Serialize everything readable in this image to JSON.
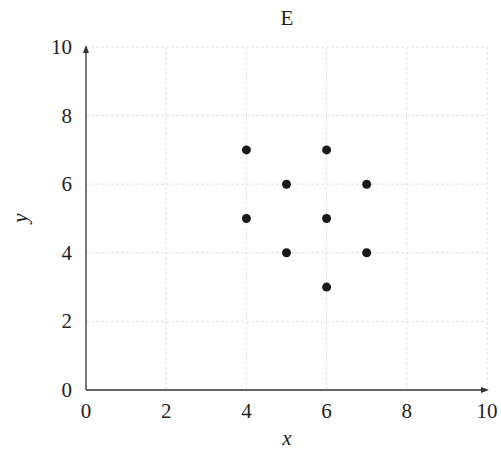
{
  "chart_data": {
    "type": "scatter",
    "title": "E",
    "xlabel": "x",
    "ylabel": "y",
    "xlim": [
      0,
      10
    ],
    "ylim": [
      0,
      10
    ],
    "xticks": [
      0,
      2,
      4,
      6,
      8,
      10
    ],
    "yticks": [
      0,
      2,
      4,
      6,
      8,
      10
    ],
    "grid": true,
    "legend": null,
    "points": [
      {
        "x": 4,
        "y": 7
      },
      {
        "x": 6,
        "y": 7
      },
      {
        "x": 5,
        "y": 6
      },
      {
        "x": 7,
        "y": 6
      },
      {
        "x": 4,
        "y": 5
      },
      {
        "x": 6,
        "y": 5
      },
      {
        "x": 5,
        "y": 4
      },
      {
        "x": 7,
        "y": 4
      },
      {
        "x": 6,
        "y": 3
      }
    ],
    "marker_color": "#1a1a1a"
  }
}
